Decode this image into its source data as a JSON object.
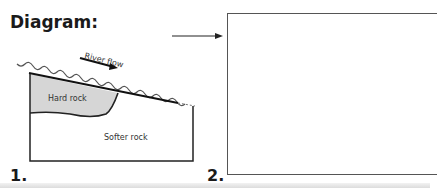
{
  "title": "Diagram:",
  "panels": [
    {
      "number": "1.",
      "labels": {
        "flow": "River flow",
        "hard": "Hard rock",
        "soft": "Softer rock"
      }
    },
    {
      "number": "2.",
      "content": ""
    }
  ],
  "colors": {
    "hard_rock_fill": "#d6d6d6",
    "line": "#222222",
    "box_border": "#555555"
  }
}
